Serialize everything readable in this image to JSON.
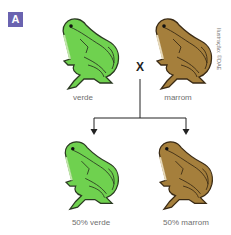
{
  "panel": {
    "badge": "A",
    "credit": "Ilustração: ©DAE",
    "cross_symbol": "X"
  },
  "parents": [
    {
      "label": "verde",
      "color": "#6fd14f",
      "stroke": "#2b3a22"
    },
    {
      "label": "marrom",
      "color": "#a57f3c",
      "stroke": "#3a2a14"
    }
  ],
  "offspring": [
    {
      "label": "50% verde",
      "color": "#6fd14f"
    },
    {
      "label": "50% marrom",
      "color": "#a57f3c"
    }
  ],
  "colors": {
    "badge_bg": "#6a63b0",
    "line": "#222222",
    "label_text": "#6f6f6f"
  }
}
